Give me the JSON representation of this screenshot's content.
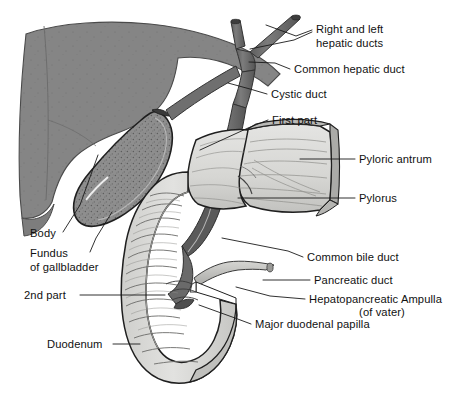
{
  "figure": {
    "background_color": "#ffffff",
    "ink_color": "#111111"
  },
  "palette": {
    "liver": "#858585",
    "liver_edge": "#4a4a4a",
    "gallbladder_fill": "#8e8e8e",
    "gallbladder_speckle": "#5f5f5f",
    "duct_dark": "#6e6e6e",
    "duodenum_fill": "#d8d8d6",
    "duodenum_shade": "#bdbdba",
    "stomach_fill": "#dcdcda",
    "pancreatic_duct": "#c3c3c0",
    "line": "#2b2b2b",
    "leader": "#1a1a1a"
  },
  "labels": [
    {
      "id": "right-and-left-hepatic-ducts",
      "lines": [
        "Right and left",
        "hepatic ducts"
      ],
      "side": "right",
      "text_x": 316,
      "text_y": 33,
      "line_height": 14,
      "leaders": [
        {
          "points": "312,30 296,36 266,25"
        },
        {
          "points": "312,32 294,40 250,49"
        }
      ]
    },
    {
      "id": "common-hepatic-duct",
      "lines": [
        "Common hepatic duct"
      ],
      "side": "right",
      "text_x": 294,
      "text_y": 73,
      "line_height": 14,
      "leaders": [
        {
          "points": "290,69 275,63 249,62"
        }
      ]
    },
    {
      "id": "cystic-duct",
      "lines": [
        "Cystic duct"
      ],
      "side": "right",
      "text_x": 271,
      "text_y": 98,
      "line_height": 14,
      "leaders": [
        {
          "points": "267,94 250,89 228,83"
        }
      ]
    },
    {
      "id": "first-part",
      "lines": [
        "First part"
      ],
      "side": "right",
      "text_x": 272,
      "text_y": 124,
      "line_height": 14,
      "leaders": [
        {
          "points": "268,120 248,128 200,150"
        }
      ]
    },
    {
      "id": "pyloric-antrum",
      "lines": [
        "Pyloric antrum"
      ],
      "side": "right",
      "text_x": 359,
      "text_y": 163,
      "line_height": 14,
      "leaders": [
        {
          "points": "355,159 300,159"
        }
      ]
    },
    {
      "id": "pylorus",
      "lines": [
        "Pylorus"
      ],
      "side": "right",
      "text_x": 359,
      "text_y": 202,
      "line_height": 14,
      "leaders": [
        {
          "points": "355,198 238,198"
        }
      ]
    },
    {
      "id": "common-bile-duct",
      "lines": [
        "Common bile duct"
      ],
      "side": "right",
      "text_x": 307,
      "text_y": 261,
      "line_height": 14,
      "leaders": [
        {
          "points": "303,257 288,251 222,238"
        }
      ]
    },
    {
      "id": "pancreatic-duct",
      "lines": [
        "Pancreatic duct"
      ],
      "side": "right",
      "text_x": 314,
      "text_y": 284,
      "line_height": 14,
      "leaders": [
        {
          "points": "310,280 263,280"
        }
      ]
    },
    {
      "id": "hepatopancreatic-ampulla",
      "lines": [
        "Hepatopancreatic Ampulla",
        "(of vater)"
      ],
      "side": "right",
      "text_x": 309,
      "text_y": 303,
      "line_height": 13,
      "second_line_anchor": "middle",
      "second_line_x": 382,
      "leaders": [
        {
          "points": "305,299 270,296 236,287"
        }
      ]
    },
    {
      "id": "major-duodenal-papilla",
      "lines": [
        "Major duodenal papilla"
      ],
      "side": "right",
      "text_x": 255,
      "text_y": 328,
      "line_height": 14,
      "leaders": [
        {
          "points": "251,324 235,318 199,305"
        }
      ]
    },
    {
      "id": "body",
      "lines": [
        "Body"
      ],
      "side": "left",
      "text_x": 30,
      "text_y": 237,
      "line_height": 14,
      "leaders": [
        {
          "points": "63,232 80,205 98,155"
        }
      ]
    },
    {
      "id": "fundus-of-gallbladder",
      "lines": [
        "Fundus",
        "of gallbladder"
      ],
      "side": "left",
      "text_x": 30,
      "text_y": 257,
      "line_height": 14,
      "leaders": [
        {
          "points": "90,252 96,238 112,212"
        }
      ]
    },
    {
      "id": "2nd-part",
      "lines": [
        "2nd part"
      ],
      "side": "left",
      "text_x": 24,
      "text_y": 299,
      "line_height": 14,
      "leaders": [
        {
          "points": "80,295 165,295"
        }
      ]
    },
    {
      "id": "duodenum",
      "lines": [
        "Duodenum"
      ],
      "side": "left",
      "text_x": 47,
      "text_y": 348,
      "line_height": 14,
      "leaders": [
        {
          "points": "113,344 140,344"
        }
      ]
    }
  ],
  "structures": [
    {
      "id": "liver",
      "name": "Liver"
    },
    {
      "id": "gallbladder",
      "name": "Gallbladder"
    },
    {
      "id": "right-hepatic-duct",
      "name": "Right hepatic duct"
    },
    {
      "id": "left-hepatic-duct",
      "name": "Left hepatic duct"
    },
    {
      "id": "common-hepatic-duct",
      "name": "Common hepatic duct"
    },
    {
      "id": "cystic-duct",
      "name": "Cystic duct"
    },
    {
      "id": "common-bile-duct",
      "name": "Common bile duct"
    },
    {
      "id": "pancreatic-duct",
      "name": "Pancreatic duct"
    },
    {
      "id": "stomach-pyloric-antrum",
      "name": "Pyloric antrum of stomach"
    },
    {
      "id": "pylorus",
      "name": "Pylorus"
    },
    {
      "id": "duodenum-first-part",
      "name": "First part of duodenum"
    },
    {
      "id": "duodenum-second-part",
      "name": "Second part of duodenum"
    },
    {
      "id": "major-duodenal-papilla",
      "name": "Major duodenal papilla"
    }
  ]
}
